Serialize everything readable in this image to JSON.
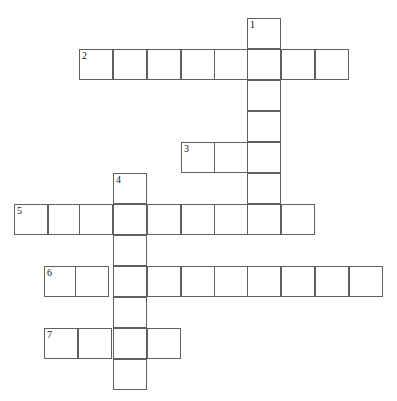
{
  "page": {
    "title_strip": "",
    "background_color": "#ffffff",
    "grid_line_color": "#5f5f5f",
    "cell_fill_color": "#ffffff",
    "number_color": "#111111",
    "width": 397,
    "height": 401
  },
  "puzzle": {
    "type": "crossword",
    "cell_width": 34,
    "cell_height": 31,
    "entries": [
      {
        "number": "1",
        "direction": "down",
        "length": 7,
        "start_col": 7,
        "start_row": 0,
        "answer": ""
      },
      {
        "number": "2",
        "direction": "across",
        "length": 8,
        "start_col": 2,
        "start_row": 1,
        "answer": ""
      },
      {
        "number": "3",
        "direction": "across",
        "length": 3,
        "start_col": 5,
        "start_row": 4,
        "answer": ""
      },
      {
        "number": "4",
        "direction": "down",
        "length": 7,
        "start_col": 3,
        "start_row": 5,
        "answer": ""
      },
      {
        "number": "5",
        "direction": "across",
        "length": 9,
        "start_col": 0,
        "start_row": 6,
        "answer": ""
      },
      {
        "number": "6",
        "direction": "across",
        "length": 10,
        "start_col": 1,
        "start_row": 8,
        "answer": ""
      },
      {
        "number": "7",
        "direction": "across",
        "length": 5,
        "start_col": 1,
        "start_row": 10,
        "answer": ""
      }
    ],
    "cells": [
      {
        "name": "cell-r0c7",
        "x": 247,
        "y": 18,
        "number": "1",
        "letter": ""
      },
      {
        "name": "cell-r1c2",
        "x": 79,
        "y": 49,
        "number": "2",
        "letter": ""
      },
      {
        "name": "cell-r1c3",
        "x": 113,
        "y": 49,
        "number": "",
        "letter": ""
      },
      {
        "name": "cell-r1c4",
        "x": 147,
        "y": 49,
        "number": "",
        "letter": ""
      },
      {
        "name": "cell-r1c5",
        "x": 181,
        "y": 49,
        "number": "",
        "letter": ""
      },
      {
        "name": "cell-r1c6",
        "x": 214,
        "y": 49,
        "number": "",
        "letter": ""
      },
      {
        "name": "cell-r1c7",
        "x": 247,
        "y": 49,
        "number": "",
        "letter": ""
      },
      {
        "name": "cell-r1c8",
        "x": 281,
        "y": 49,
        "number": "",
        "letter": ""
      },
      {
        "name": "cell-r1c9",
        "x": 315,
        "y": 49,
        "number": "",
        "letter": ""
      },
      {
        "name": "cell-r2c7",
        "x": 247,
        "y": 80,
        "number": "",
        "letter": ""
      },
      {
        "name": "cell-r3c7",
        "x": 247,
        "y": 111,
        "number": "",
        "letter": ""
      },
      {
        "name": "cell-r4c5",
        "x": 181,
        "y": 142,
        "number": "3",
        "letter": ""
      },
      {
        "name": "cell-r4c6",
        "x": 214,
        "y": 142,
        "number": "",
        "letter": ""
      },
      {
        "name": "cell-r4c7",
        "x": 247,
        "y": 142,
        "number": "",
        "letter": ""
      },
      {
        "name": "cell-r5c3",
        "x": 113,
        "y": 173,
        "number": "4",
        "letter": ""
      },
      {
        "name": "cell-r5c7",
        "x": 247,
        "y": 173,
        "number": "",
        "letter": ""
      },
      {
        "name": "cell-r6c0",
        "x": 14,
        "y": 204,
        "number": "5",
        "letter": ""
      },
      {
        "name": "cell-r6c1",
        "x": 48,
        "y": 204,
        "number": "",
        "letter": ""
      },
      {
        "name": "cell-r6c2",
        "x": 79,
        "y": 204,
        "number": "",
        "letter": ""
      },
      {
        "name": "cell-r6c3",
        "x": 113,
        "y": 204,
        "number": "",
        "letter": ""
      },
      {
        "name": "cell-r6c4",
        "x": 147,
        "y": 204,
        "number": "",
        "letter": ""
      },
      {
        "name": "cell-r6c5",
        "x": 181,
        "y": 204,
        "number": "",
        "letter": ""
      },
      {
        "name": "cell-r6c6",
        "x": 214,
        "y": 204,
        "number": "",
        "letter": ""
      },
      {
        "name": "cell-r6c7",
        "x": 247,
        "y": 204,
        "number": "",
        "letter": ""
      },
      {
        "name": "cell-r6c8",
        "x": 281,
        "y": 204,
        "number": "",
        "letter": ""
      },
      {
        "name": "cell-r7c3",
        "x": 113,
        "y": 235,
        "number": "",
        "letter": ""
      },
      {
        "name": "cell-r8c1",
        "x": 44,
        "y": 266,
        "number": "6",
        "letter": ""
      },
      {
        "name": "cell-r8c2",
        "x": 75,
        "y": 266,
        "number": "",
        "letter": ""
      },
      {
        "name": "cell-r8c3",
        "x": 113,
        "y": 266,
        "number": "",
        "letter": ""
      },
      {
        "name": "cell-r8c4",
        "x": 147,
        "y": 266,
        "number": "",
        "letter": ""
      },
      {
        "name": "cell-r8c5",
        "x": 181,
        "y": 266,
        "number": "",
        "letter": ""
      },
      {
        "name": "cell-r8c6",
        "x": 214,
        "y": 266,
        "number": "",
        "letter": ""
      },
      {
        "name": "cell-r8c7",
        "x": 247,
        "y": 266,
        "number": "",
        "letter": ""
      },
      {
        "name": "cell-r8c8",
        "x": 281,
        "y": 266,
        "number": "",
        "letter": ""
      },
      {
        "name": "cell-r8c9",
        "x": 315,
        "y": 266,
        "number": "",
        "letter": ""
      },
      {
        "name": "cell-r8c10",
        "x": 349,
        "y": 266,
        "number": "",
        "letter": ""
      },
      {
        "name": "cell-r9c3",
        "x": 113,
        "y": 297,
        "number": "",
        "letter": ""
      },
      {
        "name": "cell-r10c1",
        "x": 44,
        "y": 328,
        "number": "7",
        "letter": ""
      },
      {
        "name": "cell-r10c2",
        "x": 78,
        "y": 328,
        "number": "",
        "letter": ""
      },
      {
        "name": "cell-r10c3",
        "x": 113,
        "y": 328,
        "number": "",
        "letter": ""
      },
      {
        "name": "cell-r10c4",
        "x": 147,
        "y": 328,
        "number": "",
        "letter": ""
      },
      {
        "name": "cell-r11c3",
        "x": 113,
        "y": 359,
        "number": "",
        "letter": ""
      }
    ]
  }
}
